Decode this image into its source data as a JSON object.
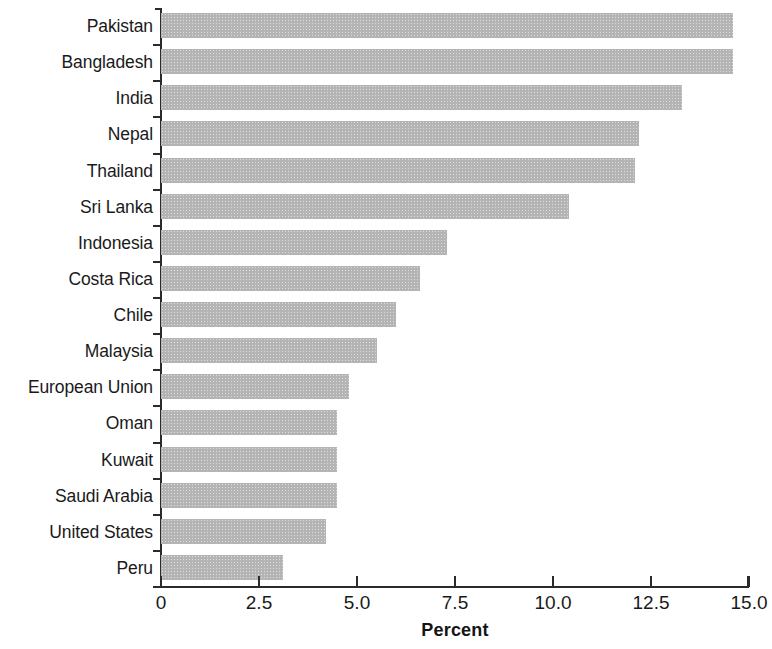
{
  "chart_data": {
    "type": "bar",
    "orientation": "horizontal",
    "title": "",
    "xlabel": "Percent",
    "ylabel": "",
    "xlim": [
      0,
      15
    ],
    "xticks": [
      0,
      2.5,
      5.0,
      7.5,
      10.0,
      12.5,
      15.0
    ],
    "xtick_labels": [
      "0",
      "2.5",
      "5.0",
      "7.5",
      "10.0",
      "12.5",
      "15.0"
    ],
    "grid": false,
    "legend": null,
    "bar_color": "#b4b4b4",
    "axis_color": "#2b2b2b",
    "categories": [
      "Pakistan",
      "Bangladesh",
      "India",
      "Nepal",
      "Thailand",
      "Sri Lanka",
      "Indonesia",
      "Costa Rica",
      "Chile",
      "Malaysia",
      "European Union",
      "Oman",
      "Kuwait",
      "Saudi Arabia",
      "United States",
      "Peru"
    ],
    "values": [
      14.6,
      14.6,
      13.3,
      12.2,
      12.1,
      10.4,
      7.3,
      6.6,
      6.0,
      5.5,
      4.8,
      4.5,
      4.5,
      4.5,
      4.2,
      3.1
    ]
  }
}
